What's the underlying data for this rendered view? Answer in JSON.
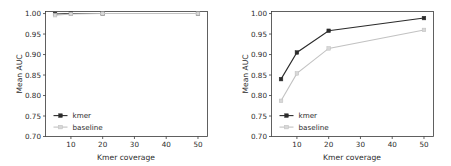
{
  "figure": {
    "background_color": "#ffffff",
    "panel_count": 2
  },
  "style": {
    "kmer_color": "#2b2b2b",
    "baseline_color": "#c2c2c2",
    "axis_color": "#3a3a3a",
    "text_color": "#2b2b2b"
  },
  "chart_data": [
    {
      "id": "left-panel",
      "type": "line",
      "title": "",
      "xlabel": "Kmer coverage",
      "ylabel": "Mean AUC",
      "x": [
        5,
        10,
        20,
        50
      ],
      "xlim": [
        2,
        53
      ],
      "ylim": [
        0.7,
        1.005
      ],
      "xticks": [
        10,
        20,
        30,
        40,
        50
      ],
      "xticklabels": [
        "10",
        "20",
        "30",
        "40",
        "50"
      ],
      "yticks": [
        0.7,
        0.75,
        0.8,
        0.85,
        0.9,
        0.95,
        1.0
      ],
      "yticklabels": [
        "0.70",
        "0.75",
        "0.80",
        "0.85",
        "0.90",
        "0.95",
        "1.00"
      ],
      "grid": false,
      "legend_position": "lower left",
      "series": [
        {
          "name": "kmer",
          "color": "#2b2b2b",
          "marker": "square",
          "values": [
            0.999,
            1.0,
            1.0,
            1.0
          ]
        },
        {
          "name": "baseline",
          "color": "#c2c2c2",
          "marker": "square",
          "values": [
            0.996,
            0.999,
            1.0,
            1.0
          ]
        }
      ]
    },
    {
      "id": "right-panel",
      "type": "line",
      "title": "",
      "xlabel": "Kmer coverage",
      "ylabel": "Mean AUC",
      "x": [
        5,
        10,
        20,
        50
      ],
      "xlim": [
        2,
        53
      ],
      "ylim": [
        0.7,
        1.005
      ],
      "xticks": [
        10,
        20,
        30,
        40,
        50
      ],
      "xticklabels": [
        "10",
        "20",
        "30",
        "40",
        "50"
      ],
      "yticks": [
        0.7,
        0.75,
        0.8,
        0.85,
        0.9,
        0.95,
        1.0
      ],
      "yticklabels": [
        "0.70",
        "0.75",
        "0.80",
        "0.85",
        "0.90",
        "0.95",
        "1.00"
      ],
      "grid": false,
      "legend_position": "lower left",
      "series": [
        {
          "name": "kmer",
          "color": "#2b2b2b",
          "marker": "square",
          "values": [
            0.84,
            0.905,
            0.958,
            0.989
          ]
        },
        {
          "name": "baseline",
          "color": "#c2c2c2",
          "marker": "square",
          "values": [
            0.787,
            0.854,
            0.915,
            0.96
          ]
        }
      ]
    }
  ]
}
